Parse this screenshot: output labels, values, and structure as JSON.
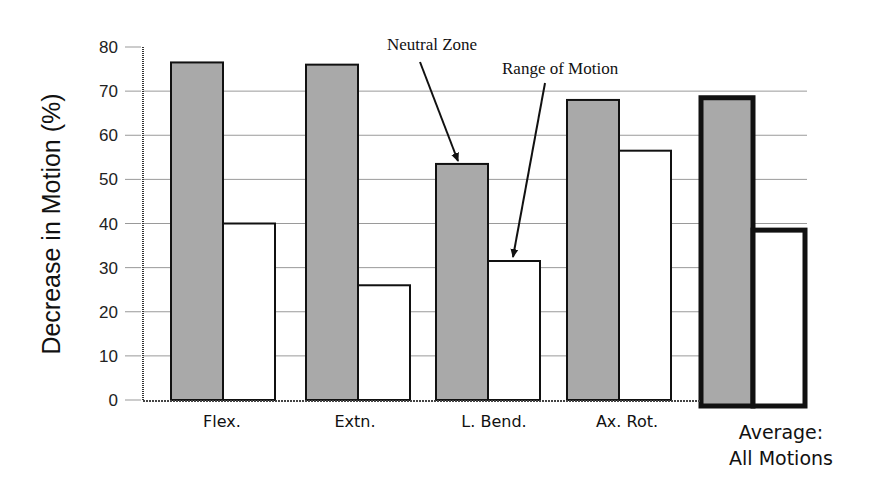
{
  "chart_data": {
    "type": "bar",
    "title": "",
    "xlabel": "",
    "ylabel": "Decrease in Motion (%)",
    "ylim": [
      0,
      80
    ],
    "yticks": [
      0,
      10,
      20,
      30,
      40,
      50,
      60,
      70,
      80
    ],
    "grid": true,
    "categories": [
      "Flex.",
      "Extn.",
      "L. Bend.",
      "Ax. Rot.",
      "Average: All Motions"
    ],
    "series": [
      {
        "name": "Neutral Zone",
        "color": "#a9a9a9",
        "values": [
          76.5,
          76,
          53.5,
          68,
          68.5
        ]
      },
      {
        "name": "Range of Motion",
        "color": "#ffffff",
        "values": [
          40,
          26,
          31.5,
          56.5,
          38.5
        ]
      }
    ],
    "annotations": [
      {
        "text": "Neutral Zone",
        "points_to": "L. Bend. / Neutral Zone"
      },
      {
        "text": "Range of Motion",
        "points_to": "L. Bend. / Range of Motion"
      }
    ],
    "highlighted_category": "Average: All Motions"
  },
  "labels": {
    "ylabel": "Decrease in Motion (%)",
    "ticks": [
      "0",
      "10",
      "20",
      "30",
      "40",
      "50",
      "60",
      "70",
      "80"
    ],
    "categories": [
      "Flex.",
      "Extn.",
      "L. Bend.",
      "Ax. Rot."
    ],
    "average_line1": "Average:",
    "average_line2": "All Motions",
    "annot_nz": "Neutral Zone",
    "annot_rom": "Range of Motion"
  }
}
